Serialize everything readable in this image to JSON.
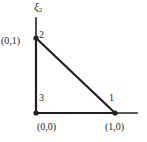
{
  "figure": {
    "type": "reference-triangle-element",
    "background_color": "#ffffff",
    "line_color": "#231f20",
    "axis": {
      "vertical_label_symbol": "ξ",
      "vertical_label_subscript": "2",
      "vertical_label_full": "ξ2",
      "vertical_axis_from": [
        36,
        113
      ],
      "vertical_axis_to": [
        36,
        18
      ],
      "horizontal_axis_from": [
        36,
        113
      ],
      "horizontal_axis_to": [
        137,
        113
      ]
    },
    "triangle": {
      "edges": [
        {
          "from": [
            36,
            38
          ],
          "to": [
            36,
            113
          ]
        },
        {
          "from": [
            36,
            113
          ],
          "to": [
            115,
            113
          ]
        },
        {
          "from": [
            115,
            113
          ],
          "to": [
            36,
            38
          ]
        }
      ]
    },
    "nodes": [
      {
        "number": "1",
        "coord_label": "(1,0)",
        "x": 115,
        "y": 113
      },
      {
        "number": "2",
        "coord_label": "(0,1)",
        "x": 36,
        "y": 38
      },
      {
        "number": "3",
        "coord_label": "(0,0)",
        "x": 36,
        "y": 113
      }
    ],
    "node_numbers": {
      "one": "1",
      "two": "2",
      "three": "3"
    },
    "coords": {
      "origin": "(0,0)",
      "right": "(1,0)",
      "top": "(0,1)"
    }
  }
}
